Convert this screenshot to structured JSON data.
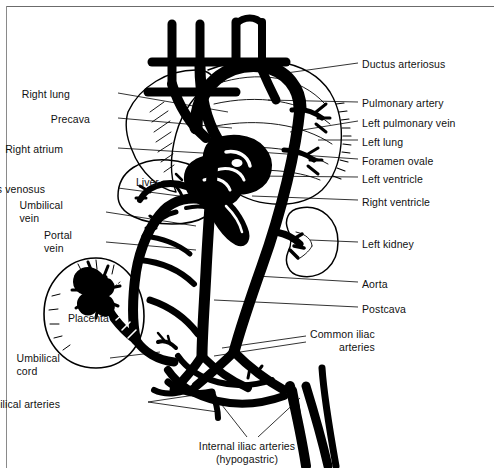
{
  "figure": {
    "title_alt": "Fetal circulation diagram",
    "ink_color": "#000000",
    "background_color": "#ffffff",
    "frame_color": "#6b6b6b"
  },
  "labels_left": [
    {
      "name": "right-lung",
      "text": "Right lung",
      "x": 70,
      "y": 88,
      "align": "right",
      "leader": [
        [
          118,
          93
        ],
        [
          228,
          112
        ]
      ]
    },
    {
      "name": "precava",
      "text": "Precava",
      "x": 90,
      "y": 113,
      "align": "right",
      "leader": [
        [
          118,
          118
        ],
        [
          232,
          128
        ]
      ]
    },
    {
      "name": "right-atrium",
      "text": "Right atrium",
      "x": 63,
      "y": 143,
      "align": "right",
      "leader": [
        [
          118,
          148
        ],
        [
          236,
          155
        ]
      ]
    },
    {
      "name": "ductus-venosus",
      "text": "Ductus venosus",
      "x": 45,
      "y": 183,
      "align": "right",
      "leader": [
        [
          118,
          188
        ],
        [
          210,
          200
        ]
      ]
    },
    {
      "name": "umbilical-vein",
      "text": "Umbilical\nvein",
      "x": 63,
      "y": 199,
      "align": "right",
      "leader": [
        [
          106,
          212
        ],
        [
          196,
          226
        ]
      ]
    },
    {
      "name": "portal-vein",
      "text": "Portal\nvein",
      "x": 72,
      "y": 229,
      "align": "right",
      "leader": [
        [
          106,
          242
        ],
        [
          196,
          250
        ]
      ]
    },
    {
      "name": "umbilical-cord",
      "text": "Umbilical\ncord",
      "x": 60,
      "y": 352,
      "align": "right",
      "leader": [
        [
          110,
          358
        ],
        [
          160,
          352
        ]
      ]
    },
    {
      "name": "umbilical-arteries",
      "text": "Umbilical arteries",
      "x": 60,
      "y": 398,
      "align": "right",
      "leader": [
        [
          148,
          402
        ],
        [
          215,
          392
        ]
      ],
      "leader2": [
        [
          148,
          402
        ],
        [
          218,
          412
        ]
      ]
    }
  ],
  "labels_right": [
    {
      "name": "ductus-arteriosus",
      "text": "Ductus arteriosus",
      "x": 362,
      "y": 58,
      "leader": [
        [
          358,
          63
        ],
        [
          272,
          75
        ]
      ]
    },
    {
      "name": "pulmonary-artery",
      "text": "Pulmonary artery",
      "x": 362,
      "y": 97,
      "leader": [
        [
          358,
          102
        ],
        [
          268,
          100
        ]
      ]
    },
    {
      "name": "left-pulmonary-vein",
      "text": "Left pulmonary vein",
      "x": 362,
      "y": 117,
      "leader": [
        [
          358,
          121
        ],
        [
          290,
          132
        ]
      ]
    },
    {
      "name": "left-lung",
      "text": "Left lung",
      "x": 362,
      "y": 136,
      "leader": [
        [
          358,
          140
        ],
        [
          318,
          140
        ]
      ]
    },
    {
      "name": "foramen-ovale",
      "text": "Foramen ovale",
      "x": 362,
      "y": 155,
      "leader": [
        [
          358,
          159
        ],
        [
          258,
          152
        ]
      ]
    },
    {
      "name": "left-ventricle",
      "text": "Left ventricle",
      "x": 362,
      "y": 173,
      "leader": [
        [
          358,
          177
        ],
        [
          256,
          176
        ]
      ]
    },
    {
      "name": "right-ventricle",
      "text": "Right ventricle",
      "x": 362,
      "y": 196,
      "leader": [
        [
          358,
          200
        ],
        [
          252,
          196
        ]
      ]
    },
    {
      "name": "left-kidney",
      "text": "Left kidney",
      "x": 362,
      "y": 238,
      "leader": [
        [
          358,
          242
        ],
        [
          310,
          240
        ]
      ]
    },
    {
      "name": "aorta",
      "text": "Aorta",
      "x": 362,
      "y": 278,
      "leader": [
        [
          358,
          282
        ],
        [
          256,
          276
        ]
      ]
    },
    {
      "name": "postcava",
      "text": "Postcava",
      "x": 362,
      "y": 303,
      "leader": [
        [
          358,
          307
        ],
        [
          214,
          300
        ]
      ]
    },
    {
      "name": "common-iliac-arteries",
      "text": "Common iliac\narteries",
      "x": 310,
      "y": 328,
      "leader": [
        [
          306,
          336
        ],
        [
          222,
          348
        ]
      ],
      "leader2": [
        [
          306,
          342
        ],
        [
          214,
          356
        ]
      ]
    }
  ],
  "labels_bottom": [
    {
      "name": "internal-iliac-arteries",
      "text": "Internal iliac arteries\n(hypogastric)",
      "x": 247,
      "y": 440,
      "align": "center",
      "leader": [
        [
          247,
          437
        ],
        [
          218,
          400
        ]
      ],
      "leader2": [
        [
          258,
          437
        ],
        [
          300,
          398
        ]
      ]
    }
  ],
  "organ_labels": [
    {
      "name": "liver-label",
      "text": "Liver",
      "x": 136,
      "y": 176
    },
    {
      "name": "placenta-label",
      "text": "Placenta",
      "x": 68,
      "y": 312
    }
  ]
}
